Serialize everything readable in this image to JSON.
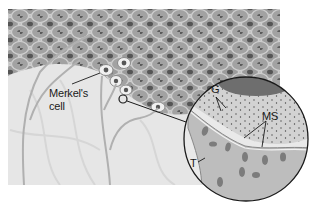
{
  "figure": {
    "colors": {
      "background": "#ffffff",
      "dermis": "#e6e6e6",
      "epidermis_cell": "#9a9a9a",
      "epidermis_border": "#c8c8c8",
      "nucleus": "#5a5a5a",
      "merkel_cell": "#f0f0f0",
      "nerve_fiber": "#b5b5b5",
      "circle_outline": "#1a1a1a",
      "label_text": "#1a1a1a"
    },
    "labels": {
      "merkel_line1": "Merkel's",
      "merkel_line2": "cell",
      "g": "G",
      "ms": "MS",
      "t": "T"
    },
    "magnifier": {
      "small_circle": {
        "cx": 123,
        "cy": 99,
        "r": 4
      },
      "large_circle": {
        "cx": 246,
        "cy": 139,
        "r": 63
      }
    }
  }
}
